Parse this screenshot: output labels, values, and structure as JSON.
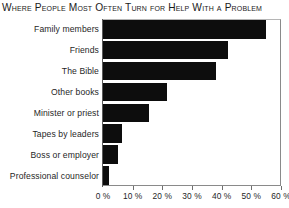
{
  "chart_data": {
    "type": "bar",
    "orientation": "horizontal",
    "title": "Where People Most Often Turn for Help With a Problem",
    "xlabel": "",
    "ylabel": "",
    "categories": [
      "Family members",
      "Friends",
      "The Bible",
      "Other books",
      "Minister or priest",
      "Tapes by leaders",
      "Boss or employer",
      "Professional counselor"
    ],
    "values": [
      55,
      42,
      38,
      21.5,
      15.5,
      6.5,
      5,
      2
    ],
    "xlim": [
      0,
      60
    ],
    "xticks": [
      0,
      10,
      20,
      30,
      40,
      50,
      60
    ],
    "xtick_labels": [
      "0 %",
      "10 %",
      "20 %",
      "30 %",
      "40 %",
      "50 %",
      "60 %"
    ],
    "grid": false,
    "legend": false,
    "bar_color": "#0d0d0d",
    "axis_color": "#6e6e6e",
    "text_color": "#1f1f1f",
    "background": "#ffffff"
  }
}
